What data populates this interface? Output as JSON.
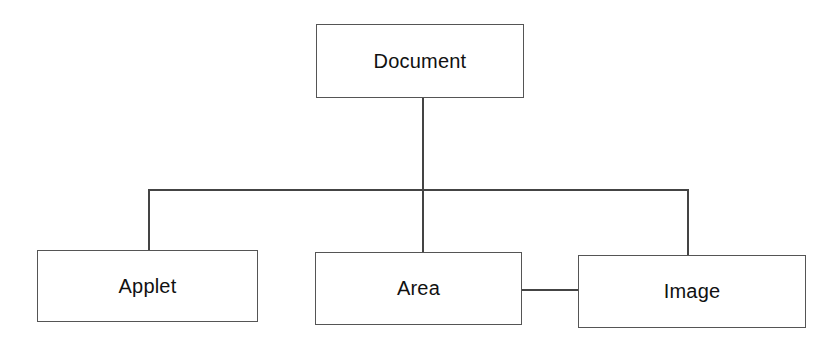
{
  "diagram": {
    "type": "hierarchy",
    "root": {
      "id": "document",
      "label": "Document"
    },
    "children": [
      {
        "id": "applet",
        "label": "Applet"
      },
      {
        "id": "area",
        "label": "Area"
      },
      {
        "id": "image",
        "label": "Image"
      }
    ],
    "edges": [
      {
        "from": "document",
        "to": "applet"
      },
      {
        "from": "document",
        "to": "area"
      },
      {
        "from": "document",
        "to": "image"
      },
      {
        "from": "area",
        "to": "image"
      }
    ]
  }
}
